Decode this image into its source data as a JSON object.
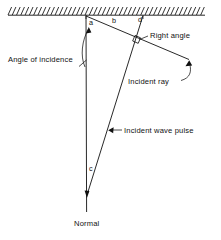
{
  "figure": {
    "type": "physics-ray-diagram",
    "background_color": "#ffffff",
    "ink_color": "#111111",
    "width": 221,
    "height": 240
  },
  "boundary": {
    "name": "hatched-boundary-surface",
    "hatch_count": 46,
    "x_start": 8,
    "x_end": 205,
    "y_top": 7,
    "y_bottom": 15
  },
  "point_labels": [
    {
      "id": "a",
      "text": "a",
      "x": 88,
      "y": 25
    },
    {
      "id": "b",
      "text": "b",
      "x": 113,
      "y": 23
    },
    {
      "id": "d",
      "text": "d",
      "x": 140,
      "y": 22
    },
    {
      "id": "c",
      "text": "c",
      "x": 89,
      "y": 171
    }
  ],
  "callouts": {
    "angle_of_incidence": "Angle of incidence",
    "right_angle": "Right angle",
    "incident_ray": "Incident ray",
    "incident_wave_pulse": "Incident wave pulse",
    "normal": "Normal"
  },
  "geometry": {
    "normal_line": {
      "x1": 86,
      "y1": 16,
      "x2": 86.5,
      "y2": 212
    },
    "wavefront_line": {
      "x1": 86,
      "y1": 16,
      "x2": 190,
      "y2": 60
    },
    "incident_ray_line": {
      "x1": 143,
      "y1": 16,
      "x2": 87,
      "y2": 195
    },
    "right_angle_marker": {
      "x": 133.5,
      "y": 36.5,
      "size": 6
    }
  },
  "chart_data": {
    "type": "diagram",
    "annotations": [
      "Angle of incidence",
      "Right angle",
      "Incident ray",
      "Incident wave pulse",
      "Normal",
      "a",
      "b",
      "c",
      "d"
    ]
  }
}
